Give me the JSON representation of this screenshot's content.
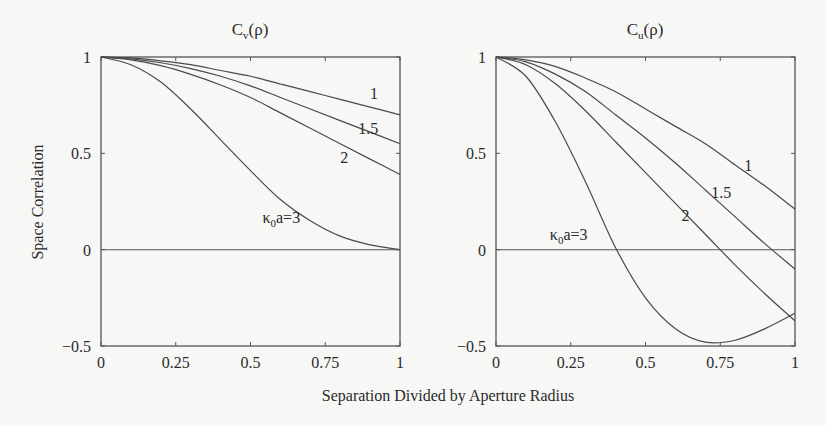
{
  "figure": {
    "ylabel": "Space Correlation",
    "xlabel": "Separation Divided by Aperture Radius"
  },
  "chart_data": [
    {
      "type": "line",
      "title": "Cv(ρ)",
      "title_main": "C",
      "title_sub": "v",
      "title_rest": "(ρ)",
      "xlabel": "Separation Divided by Aperture Radius",
      "ylabel": "Space Correlation",
      "xlim": [
        0,
        1
      ],
      "ylim": [
        -0.5,
        1
      ],
      "xticks": [
        "0",
        "0.25",
        "0.5",
        "0.75",
        "1"
      ],
      "yticks": [
        "1",
        "0.5",
        "0",
        "−0.5"
      ],
      "grid": false,
      "x": [
        0,
        0.1,
        0.2,
        0.3,
        0.4,
        0.5,
        0.6,
        0.7,
        0.8,
        0.9,
        1.0
      ],
      "series": [
        {
          "name": "1",
          "values": [
            1.0,
            0.995,
            0.98,
            0.96,
            0.93,
            0.9,
            0.86,
            0.82,
            0.78,
            0.74,
            0.7
          ]
        },
        {
          "name": "1.5",
          "values": [
            1.0,
            0.99,
            0.97,
            0.94,
            0.9,
            0.85,
            0.79,
            0.73,
            0.67,
            0.61,
            0.55
          ]
        },
        {
          "name": "2",
          "values": [
            1.0,
            0.985,
            0.955,
            0.91,
            0.855,
            0.79,
            0.71,
            0.63,
            0.55,
            0.47,
            0.39
          ]
        },
        {
          "name": "κ0a=3",
          "values": [
            1.0,
            0.96,
            0.87,
            0.73,
            0.57,
            0.41,
            0.26,
            0.15,
            0.07,
            0.025,
            0.0
          ]
        }
      ],
      "annotations": [
        {
          "text": "1",
          "x": 0.9,
          "y": 0.78
        },
        {
          "text": "1.5",
          "x": 0.86,
          "y": 0.6
        },
        {
          "text": "2",
          "x": 0.8,
          "y": 0.45
        },
        {
          "text_main": "κ",
          "text_sub": "0",
          "text_rest": "a=3",
          "x": 0.54,
          "y": 0.14
        }
      ]
    },
    {
      "type": "line",
      "title": "Cu(ρ)",
      "title_main": "C",
      "title_sub": "u",
      "title_rest": "(ρ)",
      "xlabel": "Separation Divided by Aperture Radius",
      "ylabel": "Space Correlation",
      "xlim": [
        0,
        1
      ],
      "ylim": [
        -0.5,
        1
      ],
      "xticks": [
        "0",
        "0.25",
        "0.5",
        "0.75",
        "1"
      ],
      "yticks": [
        "1",
        "0.5",
        "0",
        "−0.5"
      ],
      "grid": false,
      "x": [
        0,
        0.1,
        0.2,
        0.3,
        0.4,
        0.5,
        0.6,
        0.7,
        0.8,
        0.9,
        1.0
      ],
      "series": [
        {
          "name": "1",
          "values": [
            1.0,
            0.985,
            0.95,
            0.89,
            0.82,
            0.73,
            0.64,
            0.55,
            0.44,
            0.33,
            0.21
          ]
        },
        {
          "name": "1.5",
          "values": [
            1.0,
            0.975,
            0.91,
            0.82,
            0.7,
            0.58,
            0.45,
            0.31,
            0.17,
            0.03,
            -0.1
          ]
        },
        {
          "name": "2",
          "values": [
            1.0,
            0.96,
            0.86,
            0.72,
            0.56,
            0.4,
            0.24,
            0.08,
            -0.08,
            -0.23,
            -0.37
          ]
        },
        {
          "name": "κ0a=3",
          "values": [
            1.0,
            0.9,
            0.66,
            0.35,
            0.01,
            -0.25,
            -0.41,
            -0.48,
            -0.47,
            -0.41,
            -0.33
          ]
        }
      ],
      "annotations": [
        {
          "text": "1",
          "x": 0.83,
          "y": 0.41
        },
        {
          "text": "1.5",
          "x": 0.72,
          "y": 0.27
        },
        {
          "text": "2",
          "x": 0.62,
          "y": 0.15
        },
        {
          "text_main": "κ",
          "text_sub": "0",
          "text_rest": "a=3",
          "x": 0.18,
          "y": 0.05
        }
      ]
    }
  ]
}
